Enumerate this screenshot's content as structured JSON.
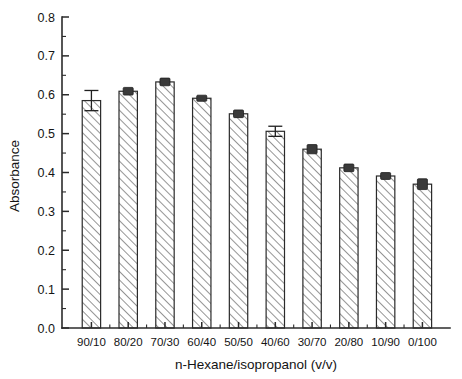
{
  "chart_data": {
    "type": "bar",
    "title": "",
    "subtitle": "",
    "xlabel": "n-Hexane/isopropanol (v/v)",
    "ylabel": "Absorbance",
    "categories": [
      "90/10",
      "80/20",
      "70/30",
      "60/40",
      "50/50",
      "40/60",
      "30/70",
      "20/80",
      "10/90",
      "0/100"
    ],
    "values": [
      0.585,
      0.609,
      0.633,
      0.591,
      0.551,
      0.506,
      0.46,
      0.412,
      0.391,
      0.37
    ],
    "errors": [
      0.026,
      0.006,
      0.006,
      0.004,
      0.006,
      0.013,
      0.008,
      0.006,
      0.005,
      0.01
    ],
    "ylim": [
      0.0,
      0.8
    ],
    "ytick_values": [
      0.0,
      0.1,
      0.2,
      0.3,
      0.4,
      0.5,
      0.6,
      0.7,
      0.8
    ],
    "ytick_labels": [
      "0.0",
      "0.1",
      "0.2",
      "0.3",
      "0.4",
      "0.5",
      "0.6",
      "0.7",
      "0.8"
    ],
    "yminor_values": [
      0.05,
      0.15,
      0.25,
      0.35,
      0.45,
      0.55,
      0.65,
      0.75
    ],
    "grid": false,
    "legend": false,
    "legend_position": "none",
    "series": [
      {
        "name": "Absorbance",
        "values": [
          0.585,
          0.609,
          0.633,
          0.591,
          0.551,
          0.506,
          0.46,
          0.412,
          0.391,
          0.37
        ]
      }
    ],
    "bar_fill": "hatched-diagonal",
    "bar_fill_color": "#ffffff",
    "bar_hatch_color": "#8a8a8a",
    "bar_edge_color": "#2a2a2a",
    "axis_color": "#2b2b2b",
    "tick_direction": "in",
    "frame": "left-bottom"
  }
}
